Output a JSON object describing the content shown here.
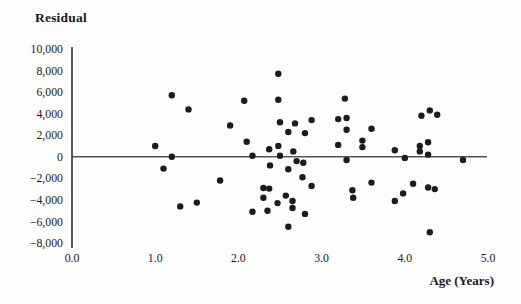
{
  "figure": {
    "width": 521,
    "height": 304
  },
  "chart_data": {
    "type": "scatter",
    "title": "Residual",
    "xlabel": "Age (Years)",
    "ylabel": "Residual",
    "xlim": [
      0.0,
      5.0
    ],
    "ylim": [
      -8000,
      10000
    ],
    "grid": false,
    "legend": null,
    "zero_line": true,
    "x_ticks": {
      "values": [
        0,
        1,
        2,
        3,
        4,
        5
      ],
      "labels": [
        "0.0",
        "1.0",
        "2.0",
        "3.0",
        "4.0",
        "5.0"
      ]
    },
    "y_ticks": {
      "values": [
        10000,
        8000,
        6000,
        4000,
        2000,
        0,
        -2000,
        -4000,
        -6000,
        -8000
      ],
      "labels": [
        "10,000",
        "8,000",
        "6,000",
        "4,000",
        "2,000",
        "0",
        "−2,000",
        "−4,000",
        "−6,000",
        "−8,000"
      ]
    },
    "points": [
      [
        1.0,
        1000
      ],
      [
        1.2,
        5700
      ],
      [
        1.2,
        0
      ],
      [
        1.4,
        4400
      ],
      [
        1.9,
        2900
      ],
      [
        2.07,
        5200
      ],
      [
        2.1,
        1400
      ],
      [
        2.17,
        100
      ],
      [
        2.37,
        700
      ],
      [
        2.48,
        7700
      ],
      [
        2.48,
        5300
      ],
      [
        2.5,
        3200
      ],
      [
        2.48,
        1000
      ],
      [
        2.5,
        100
      ],
      [
        2.6,
        2300
      ],
      [
        2.68,
        3100
      ],
      [
        2.66,
        500
      ],
      [
        2.8,
        2200
      ],
      [
        2.88,
        3400
      ],
      [
        3.2,
        3500
      ],
      [
        3.2,
        1100
      ],
      [
        3.28,
        5400
      ],
      [
        3.3,
        3600
      ],
      [
        3.3,
        2500
      ],
      [
        3.3,
        -300
      ],
      [
        3.49,
        1500
      ],
      [
        3.49,
        900
      ],
      [
        3.6,
        2600
      ],
      [
        3.88,
        600
      ],
      [
        4.0,
        -100
      ],
      [
        4.18,
        1000
      ],
      [
        4.18,
        500
      ],
      [
        4.28,
        1350
      ],
      [
        4.28,
        200
      ],
      [
        4.2,
        3800
      ],
      [
        4.3,
        4300
      ],
      [
        4.39,
        3900
      ],
      [
        4.7,
        -300
      ],
      [
        1.1,
        -1100
      ],
      [
        1.3,
        -4600
      ],
      [
        1.5,
        -4250
      ],
      [
        1.78,
        -2200
      ],
      [
        2.17,
        -5100
      ],
      [
        2.3,
        -2900
      ],
      [
        2.3,
        -3800
      ],
      [
        2.37,
        -2950
      ],
      [
        2.38,
        -800
      ],
      [
        2.35,
        -5000
      ],
      [
        2.47,
        -4300
      ],
      [
        2.6,
        -1150
      ],
      [
        2.57,
        -3600
      ],
      [
        2.6,
        -6500
      ],
      [
        2.65,
        -4100
      ],
      [
        2.65,
        -4750
      ],
      [
        2.7,
        -400
      ],
      [
        2.78,
        -550
      ],
      [
        2.77,
        -1900
      ],
      [
        2.8,
        -5300
      ],
      [
        2.88,
        -2700
      ],
      [
        3.37,
        -3100
      ],
      [
        3.38,
        -3800
      ],
      [
        3.6,
        -2400
      ],
      [
        3.88,
        -4100
      ],
      [
        3.98,
        -3400
      ],
      [
        4.1,
        -2500
      ],
      [
        4.28,
        -2850
      ],
      [
        4.36,
        -3000
      ],
      [
        4.3,
        -7000
      ]
    ],
    "colors": {
      "point": "#1c1c1c",
      "axis": "#2b2b2b",
      "zero_line": "#555555",
      "text": "#1a1a1a",
      "background": "#fdfdfb"
    }
  }
}
